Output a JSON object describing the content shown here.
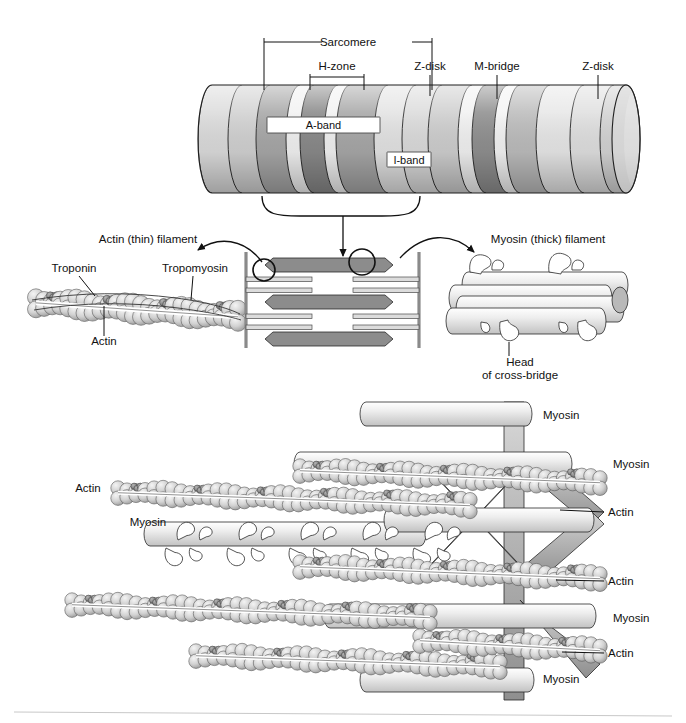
{
  "figure": {
    "background": "#ffffff"
  },
  "top_panel": {
    "name": "myofibril-cylinder",
    "callouts": [
      {
        "id": "sarcomere",
        "label": "Sarcomere",
        "type": "span-bracket"
      },
      {
        "id": "h-zone",
        "label": "H-zone",
        "type": "span-bracket"
      },
      {
        "id": "z-disk-1",
        "label": "Z-disk",
        "type": "leader"
      },
      {
        "id": "m-bridge",
        "label": "M-bridge",
        "type": "leader"
      },
      {
        "id": "z-disk-2",
        "label": "Z-disk",
        "type": "leader"
      }
    ],
    "band_labels": [
      {
        "id": "a-band",
        "label": "A-band"
      },
      {
        "id": "i-band",
        "label": "I-band"
      }
    ],
    "bands": [
      {
        "x": 212,
        "w": 30,
        "fill": "#dcdcdc"
      },
      {
        "x": 242,
        "w": 28,
        "fill": "#d2d2d2"
      },
      {
        "x": 270,
        "w": 30,
        "fill": "#a8a8a8"
      },
      {
        "x": 300,
        "w": 14,
        "fill": "#f2f2f2"
      },
      {
        "x": 314,
        "w": 24,
        "fill": "#8a8a8a"
      },
      {
        "x": 338,
        "w": 12,
        "fill": "#f2f2f2"
      },
      {
        "x": 350,
        "w": 38,
        "fill": "#a8a8a8"
      },
      {
        "x": 388,
        "w": 28,
        "fill": "#e4e4e4"
      },
      {
        "x": 416,
        "w": 26,
        "fill": "#dcdcdc"
      },
      {
        "x": 442,
        "w": 30,
        "fill": "#cfcfcf"
      },
      {
        "x": 472,
        "w": 14,
        "fill": "#f2f2f2"
      },
      {
        "x": 486,
        "w": 22,
        "fill": "#909090"
      },
      {
        "x": 508,
        "w": 12,
        "fill": "#f4f4f4"
      },
      {
        "x": 520,
        "w": 30,
        "fill": "#bdbdbd"
      },
      {
        "x": 550,
        "w": 34,
        "fill": "#e8e8e8"
      },
      {
        "x": 584,
        "w": 30,
        "fill": "#e0e0e0"
      },
      {
        "x": 614,
        "w": 24,
        "fill": "#d4d4d4"
      }
    ]
  },
  "middle_panel": {
    "name": "filament-detail-row",
    "left": {
      "name": "actin-thin-filament",
      "title": "Actin (thin) filament",
      "labels": [
        {
          "id": "troponin",
          "label": "Troponin"
        },
        {
          "id": "tropomyosin",
          "label": "Tropomyosin"
        },
        {
          "id": "actin",
          "label": "Actin"
        }
      ]
    },
    "center": {
      "name": "sarcomere-schematic",
      "thick_filament_count": 3,
      "thin_filament_pairs": 4
    },
    "right": {
      "name": "myosin-thick-filament",
      "title": "Myosin (thick) filament",
      "labels": [
        {
          "id": "cross-bridge-head",
          "line1": "Head",
          "line2": "of cross-bridge"
        }
      ]
    }
  },
  "bottom_panel": {
    "name": "three-d-lattice",
    "labels_left": [
      {
        "id": "actin-left",
        "label": "Actin",
        "x": 88,
        "y": 492
      },
      {
        "id": "myosin-left",
        "label": "Myosin",
        "x": 148,
        "y": 526
      }
    ],
    "labels_right": [
      {
        "id": "myosin-r1",
        "label": "Myosin",
        "x": 543,
        "y": 419
      },
      {
        "id": "myosin-r2",
        "label": "Myosin",
        "x": 613,
        "y": 468
      },
      {
        "id": "actin-r1",
        "label": "Actin",
        "x": 608,
        "y": 516
      },
      {
        "id": "actin-r2",
        "label": "Actin",
        "x": 608,
        "y": 585
      },
      {
        "id": "myosin-r3",
        "label": "Myosin",
        "x": 613,
        "y": 622
      },
      {
        "id": "actin-r3",
        "label": "Actin",
        "x": 608,
        "y": 657
      },
      {
        "id": "myosin-r4",
        "label": "Myosin",
        "x": 543,
        "y": 683
      }
    ]
  },
  "colors": {
    "ink": "#111111",
    "thick_filament": "#8c8c8c",
    "thin_filament": "#d8d8d8",
    "bead_light": "#cfcfcf",
    "bead_dark": "#8f8f8f",
    "z_disk": "#8a8a8a",
    "rule": "#c8c8c8"
  }
}
